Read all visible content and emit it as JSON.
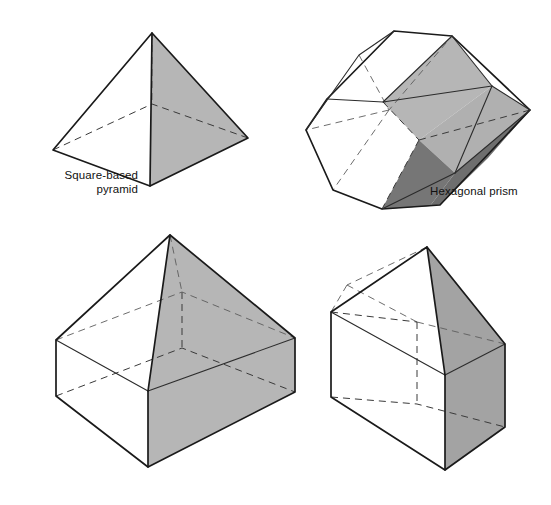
{
  "page": {
    "background_color": "#ffffff",
    "width": 551,
    "height": 505
  },
  "palette": {
    "edge_color": "#1a1a1a",
    "hidden_edge_color": "#3a3a3a",
    "face_white": "#ffffff",
    "face_light_gray": "#b6b6b6",
    "face_mid_gray": "#9a9a9a",
    "face_dark_gray": "#767676",
    "text_color": "#111111"
  },
  "labels": {
    "pyramid": "Square-based\npyramid",
    "hexagonal_prism": "Hexagonal prism"
  },
  "shapes": [
    {
      "id": "square-based-pyramid",
      "name": "Square-based pyramid",
      "labeled": true,
      "label_text": "Square-based\npyramid",
      "position": "top-left",
      "shaded_faces": 1,
      "shade": "#b6b6b6"
    },
    {
      "id": "hexagonal-prism",
      "name": "Hexagonal prism",
      "labeled": true,
      "label_text": "Hexagonal prism",
      "position": "top-right",
      "shaded_faces": 2,
      "shade": "#b6b6b6",
      "shade_dark": "#767676"
    },
    {
      "id": "cuboid-with-pyramid",
      "name": "Cuboid with square-based pyramid on top",
      "labeled": false,
      "label_text": "",
      "position": "bottom-left",
      "shaded_faces": 3,
      "shade": "#b6b6b6"
    },
    {
      "id": "cuboid-with-triangular-prism",
      "name": "Cuboid with triangular prism roof",
      "labeled": false,
      "label_text": "",
      "position": "bottom-right",
      "shaded_faces": 3,
      "shade": "#a3a3a3"
    }
  ],
  "geometry": {
    "pyramid": {
      "apex": [
        152,
        33
      ],
      "base_left": [
        53,
        150
      ],
      "base_front": [
        150,
        186
      ],
      "base_right": [
        248,
        138
      ],
      "base_back_hidden": [
        152,
        104
      ]
    },
    "hexagonal_prism": {
      "front_face": [
        [
          382,
          209
        ],
        [
          333,
          190
        ],
        [
          306,
          130
        ],
        [
          327,
          99
        ],
        [
          383,
          102
        ],
        [
          419,
          140
        ]
      ],
      "back_face": [
        [
          530,
          110
        ],
        [
          492,
          86
        ],
        [
          452,
          36
        ],
        [
          394,
          31
        ],
        [
          359,
          55
        ],
        [
          389,
          110
        ]
      ]
    },
    "cuboid_pyramid": {
      "apex": [
        170,
        235
      ],
      "top_left": [
        56,
        340
      ],
      "top_front": [
        148,
        391
      ],
      "top_right": [
        295,
        338
      ],
      "top_back_hidden": [
        182,
        292
      ],
      "bottom_left": [
        56,
        396
      ],
      "bottom_front": [
        148,
        467
      ],
      "bottom_right": [
        295,
        392
      ]
    },
    "house_prism": {
      "ridge_front": [
        427,
        247
      ],
      "ridge_back_hidden": [
        347,
        285
      ],
      "gable_left": [
        331,
        312
      ],
      "gable_front": [
        445,
        375
      ],
      "gable_right": [
        505,
        344
      ],
      "wall_bottom_left": [
        331,
        397
      ],
      "wall_bottom_front": [
        445,
        470
      ],
      "wall_bottom_right": [
        505,
        427
      ]
    }
  }
}
